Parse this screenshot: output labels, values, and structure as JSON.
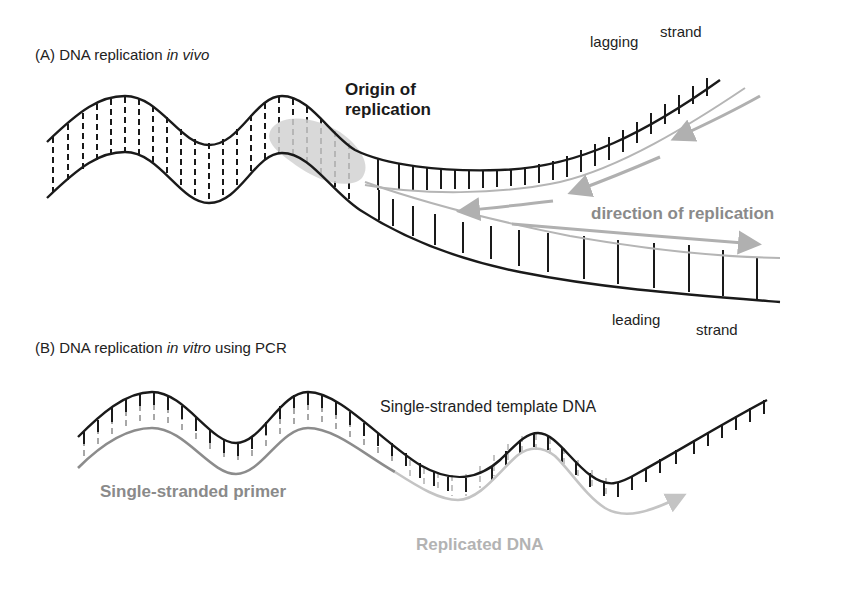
{
  "panel_a": {
    "label_prefix": "(A) DNA replication ",
    "label_italic": "in vivo",
    "origin_line1": "Origin of",
    "origin_line2": "replication",
    "lagging_word": "lagging",
    "lagging_strand_word": "strand",
    "leading_word": "leading",
    "leading_strand_word": "strand",
    "direction_label": "direction of replication"
  },
  "panel_b": {
    "label_prefix": "(B) DNA replication ",
    "label_italic": "in vitro",
    "label_suffix": " using PCR",
    "template_label": "Single-stranded template DNA",
    "primer_label": "Single-stranded primer",
    "replicated_label": "Replicated DNA"
  },
  "colors": {
    "strand_dark": "#1a1a1a",
    "new_strand_gray": "#a8a8a8",
    "primer_gray": "#8c8c8c",
    "replicated_gray": "#c4c4c4",
    "origin_blob": "#d6d6d6"
  }
}
